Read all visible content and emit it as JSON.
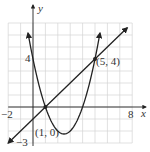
{
  "chart_data": {
    "type": "line",
    "title": "",
    "xlabel": "x",
    "ylabel": "y",
    "xlim": [
      -2,
      8
    ],
    "ylim": [
      -3,
      7
    ],
    "grid": true,
    "tick_labels": {
      "x": [
        "-2",
        "8"
      ],
      "y": [
        "4",
        "-3"
      ]
    },
    "series": [
      {
        "name": "parabola",
        "equation": "y = x^2 - 5x + 4",
        "x": [
          -0.4,
          0,
          1,
          2,
          2.5,
          3,
          4,
          5,
          5.4
        ],
        "y": [
          6.16,
          4,
          0,
          -2,
          -2.25,
          -2,
          0,
          4,
          6.16
        ]
      },
      {
        "name": "line",
        "equation": "y = x - 1",
        "x": [
          -2,
          1,
          5,
          7.6
        ],
        "y": [
          -3,
          0,
          4,
          6.6
        ]
      }
    ],
    "annotations": [
      {
        "text": "(1, 0)",
        "x": 1,
        "y": 0
      },
      {
        "text": "(5, 4)",
        "x": 5,
        "y": 4
      }
    ]
  },
  "labels": {
    "x_axis": "x",
    "y_axis": "y",
    "x_min": "−2",
    "x_max": "8",
    "y_four": "4",
    "y_min": "−3",
    "point_a": "(1, 0)",
    "point_b": "(5, 4)"
  }
}
